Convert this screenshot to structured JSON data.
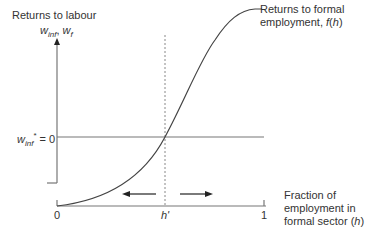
{
  "diagram": {
    "y_axis_title": "Returns to labour",
    "y_axis_vars": {
      "w1": "w",
      "w1_sub": "inf",
      "sep": ", ",
      "w2": "w",
      "w2_sub": "f"
    },
    "curve_label_line1": "Returns to formal",
    "curve_label_line2_prefix": "employment, ",
    "curve_label_fn": "f",
    "curve_label_arg": "h",
    "hline_label": {
      "w": "w",
      "sub": "inf",
      "sup": "*",
      "rest": " = 0"
    },
    "x_ticks": {
      "zero": "0",
      "hprime": "h'",
      "one": "1"
    },
    "x_axis_label_line1": "Fraction of",
    "x_axis_label_line2": "employment in",
    "x_axis_label_line3_prefix": "formal sector (",
    "x_axis_label_var": "h",
    "x_axis_label_suffix": ")",
    "line_color": "#555555",
    "arrows": [
      "left",
      "right"
    ]
  }
}
